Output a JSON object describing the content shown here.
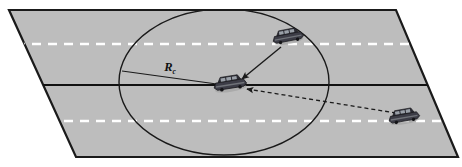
{
  "figure": {
    "width": 462,
    "height": 167,
    "background_color": "#ffffff"
  },
  "road": {
    "name": "road-surface",
    "fill_color": "#bdbdbd",
    "edge_color": "#1a1a1a",
    "corners": {
      "top_left": [
        9,
        10
      ],
      "top_right": [
        396,
        10
      ],
      "bottom_right": [
        458,
        157
      ],
      "bottom_left": [
        76,
        157
      ]
    },
    "center_line": {
      "name": "center-divider-line",
      "color": "#111111",
      "style": "solid",
      "y": 85
    },
    "lane_lines": [
      {
        "name": "lane-marking-upper",
        "color": "#ffffff",
        "style": "dashed",
        "y": 44
      },
      {
        "name": "lane-marking-lower",
        "color": "#ffffff",
        "style": "dashed",
        "y": 121
      }
    ]
  },
  "communication_range": {
    "name": "communication-range-ellipse",
    "label": "R",
    "label_subscript": "c",
    "stroke_color": "#1a1a1a",
    "center": [
      224,
      82
    ],
    "radius_x": 105,
    "radius_y": 73,
    "radius_line": {
      "name": "radius-indicator-line",
      "from": [
        122,
        71
      ],
      "to": [
        224,
        85
      ]
    },
    "label_position": [
      170,
      71
    ]
  },
  "vehicles": [
    {
      "name": "vehicle-ego-center",
      "role": "receiving vehicle",
      "position": [
        230,
        83
      ],
      "body_color": "#3c3c46",
      "roof_color": "#2b2b33",
      "window_color": "#9aa0a8"
    },
    {
      "name": "vehicle-transmitter-in-range",
      "role": "in-range transmitter",
      "position": [
        288,
        36
      ],
      "body_color": "#3c3c46",
      "roof_color": "#2b2b33",
      "window_color": "#9aa0a8"
    },
    {
      "name": "vehicle-transmitter-out-of-range",
      "role": "out-of-range transmitter",
      "position": [
        404,
        116
      ],
      "body_color": "#3c3c46",
      "roof_color": "#2b2b33",
      "window_color": "#9aa0a8"
    }
  ],
  "links": [
    {
      "name": "link-solid-in-range",
      "style": "solid",
      "color": "#1a1a1a",
      "from": [
        281,
        47
      ],
      "to": [
        240,
        80
      ],
      "arrowhead": "filled-triangle"
    },
    {
      "name": "link-dashed-out-of-range",
      "style": "dashed",
      "color": "#1a1a1a",
      "from": [
        396,
        113
      ],
      "to": [
        245,
        89
      ],
      "arrowhead": "filled-triangle"
    }
  ]
}
